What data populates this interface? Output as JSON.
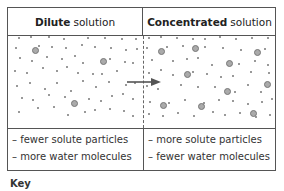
{
  "headers": {
    "left": {
      "bold": "Dilute",
      "rest": "solution"
    },
    "right": {
      "bold": "Concentrated",
      "rest": "solution"
    }
  },
  "rows": {
    "left": [
      "– fewer solute particles",
      "– more water molecules"
    ],
    "right": [
      "– more solute particles",
      "– fewer water molecules"
    ]
  },
  "key_label": "Key",
  "colors": {
    "border": "#555555",
    "solute_particle": "#aaaaaa",
    "water_molecule": "#777777",
    "arrow": "#555555"
  },
  "arrow": {
    "direction": "left-to-right",
    "from": "dilute",
    "to": "concentrated"
  }
}
